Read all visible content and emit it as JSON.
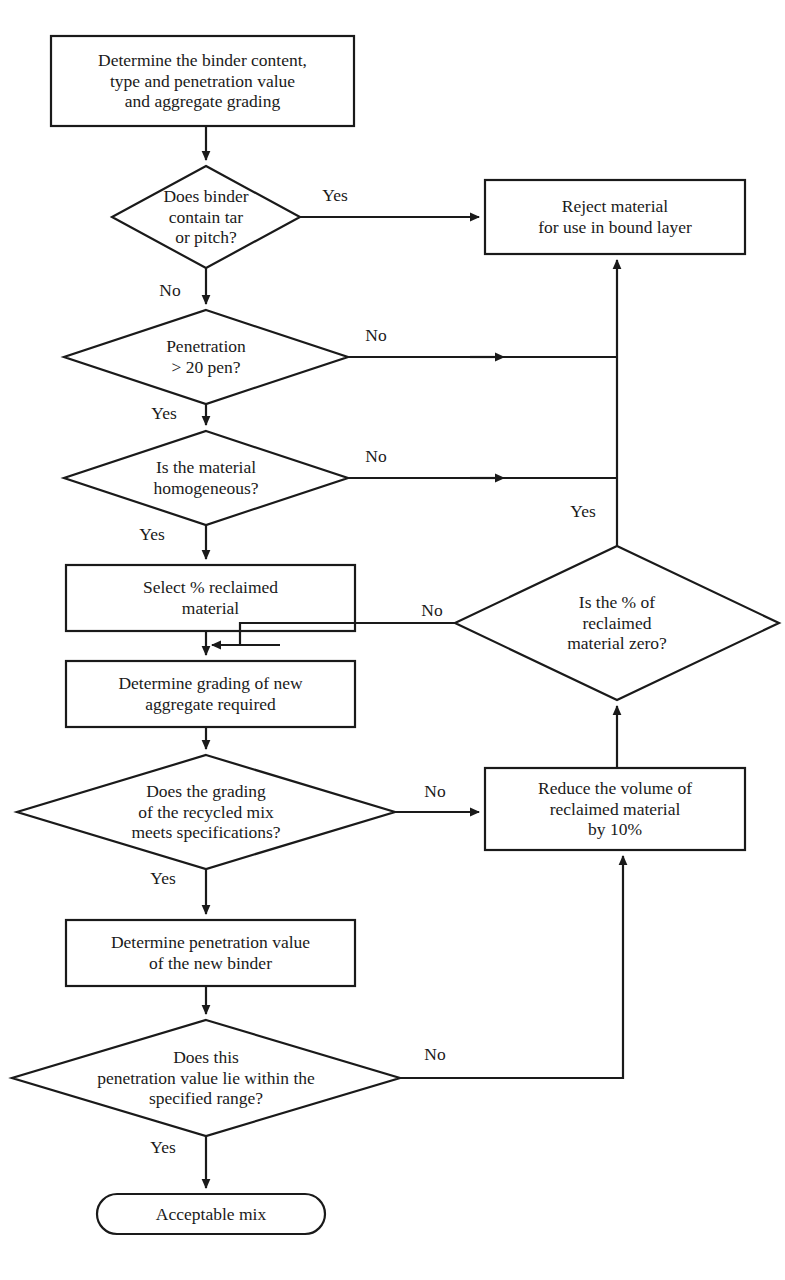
{
  "diagram": {
    "stroke_color": "#1a1a1a",
    "fill_color": "#ffffff",
    "nodes": {
      "start_box": {
        "shape": "process",
        "text": "Determine the binder content,\ntype and penetration value\nand aggregate grading"
      },
      "d_tar": {
        "shape": "decision",
        "text": "Does binder\ncontain tar\nor pitch?"
      },
      "reject_box": {
        "shape": "process",
        "text": "Reject material\nfor use in bound layer"
      },
      "d_pen20": {
        "shape": "decision",
        "text": "Penetration\n> 20 pen?"
      },
      "d_homog": {
        "shape": "decision",
        "text": "Is the material\nhomogeneous?"
      },
      "select_box": {
        "shape": "process",
        "text": "Select % reclaimed\nmaterial"
      },
      "d_zero": {
        "shape": "decision",
        "text": "Is the % of\nreclaimed\nmaterial zero?"
      },
      "grading_box": {
        "shape": "process",
        "text": "Determine grading of new\naggregate required"
      },
      "d_grading": {
        "shape": "decision",
        "text": "Does the grading\nof the recycled mix\nmeets specifications?"
      },
      "reduce_box": {
        "shape": "process",
        "text": "Reduce the volume of\nreclaimed material\nby 10%"
      },
      "penvalue_box": {
        "shape": "process",
        "text": "Determine penetration value\nof the new binder"
      },
      "d_range": {
        "shape": "decision",
        "text": "Does this\npenetration value lie within the\nspecified range?"
      },
      "end_terminal": {
        "shape": "terminal",
        "text": "Acceptable mix"
      }
    },
    "edge_labels": {
      "tar_yes": "Yes",
      "tar_no": "No",
      "pen20_no": "No",
      "pen20_yes": "Yes",
      "homog_no": "No",
      "homog_yes": "Yes",
      "zero_yes": "Yes",
      "zero_no": "No",
      "grading_no": "No",
      "grading_yes": "Yes",
      "range_no": "No",
      "range_yes": "Yes"
    }
  }
}
